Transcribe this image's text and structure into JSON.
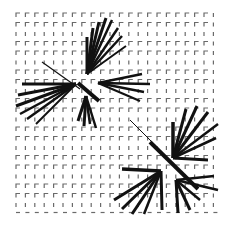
{
  "image": {
    "width": 237,
    "height": 236,
    "background": "#ffffff"
  },
  "grid": {
    "description": "Regular lattice of small L-shaped corner marks",
    "origin_x": 16,
    "origin_y": 13,
    "spacing_x": 9.4,
    "spacing_y": 9.5,
    "cols": 22,
    "rows": 22,
    "mark_size": 4,
    "mark_color": "#6a6a6a"
  },
  "starbursts": [
    {
      "name": "upper-left-burst",
      "color": "#111111",
      "diagonal": [
        {
          "x1": 42,
          "y1": 62,
          "x2": 80,
          "y2": 89,
          "w": 1.2
        },
        {
          "x1": 78,
          "y1": 83,
          "x2": 99,
          "y2": 101,
          "w": 4
        }
      ],
      "clusters": [
        {
          "ox": 87,
          "oy": 74,
          "rays": [
            [
              87,
              37,
              3
            ],
            [
              93,
              28,
              3
            ],
            [
              99,
              22,
              3
            ],
            [
              106,
              18,
              3
            ],
            [
              112,
              20,
              2.5
            ],
            [
              118,
              28,
              2.5
            ],
            [
              122,
              36,
              2.5
            ],
            [
              126,
              46,
              2
            ]
          ]
        },
        {
          "ox": 76,
          "oy": 84,
          "rays": [
            [
              22,
              84,
              3
            ],
            [
              18,
              95,
              3
            ],
            [
              16,
              106,
              3
            ],
            [
              20,
              114,
              2.5
            ],
            [
              27,
              119,
              2.5
            ],
            [
              36,
              124,
              2
            ]
          ]
        },
        {
          "ox": 98,
          "oy": 83,
          "rays": [
            [
              142,
              74,
              2.5
            ],
            [
              150,
              84,
              2.5
            ],
            [
              144,
              92,
              2.5
            ],
            [
              140,
              101,
              2
            ]
          ]
        },
        {
          "ox": 86,
          "oy": 96,
          "rays": [
            [
              78,
              121,
              3
            ],
            [
              84,
              126,
              3
            ],
            [
              90,
              124,
              2.5
            ],
            [
              96,
              128,
              2.5
            ]
          ]
        }
      ]
    },
    {
      "name": "lower-right-burst",
      "color": "#111111",
      "diagonal": [
        {
          "x1": 130,
          "y1": 120,
          "x2": 160,
          "y2": 150,
          "w": 1
        },
        {
          "x1": 150,
          "y1": 142,
          "x2": 198,
          "y2": 189,
          "w": 4
        }
      ],
      "clusters": [
        {
          "ox": 173,
          "oy": 158,
          "rays": [
            [
              173,
              122,
              3.5
            ],
            [
              186,
              109,
              3
            ],
            [
              197,
              106,
              3
            ],
            [
              208,
              112,
              3
            ],
            [
              218,
              124,
              2.5
            ],
            [
              216,
              138,
              2.5
            ],
            [
              208,
              160,
              3
            ]
          ]
        },
        {
          "ox": 161,
          "oy": 171,
          "rays": [
            [
              122,
              169,
              3.5
            ],
            [
              114,
              200,
              3
            ],
            [
              122,
              209,
              3
            ],
            [
              132,
              214,
              3
            ],
            [
              144,
              214,
              2.5
            ],
            [
              162,
              210,
              3
            ]
          ]
        },
        {
          "ox": 176,
          "oy": 180,
          "rays": [
            [
              178,
              213,
              3
            ],
            [
              190,
              210,
              3
            ],
            [
              200,
              200,
              2.5
            ],
            [
              218,
              190,
              2.5
            ],
            [
              214,
              176,
              2.5
            ]
          ]
        }
      ]
    }
  ]
}
